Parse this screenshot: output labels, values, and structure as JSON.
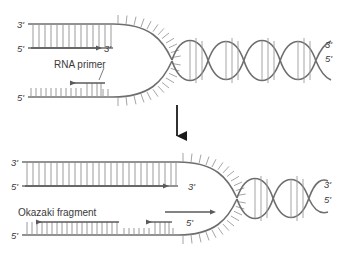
{
  "figure": {
    "background_color": "#ffffff",
    "stroke_color": "#6e6e6e",
    "rung_color": "#9a9a9a",
    "text_color": "#3a3a3a",
    "arrow_color": "#5a5a5a",
    "transition_arrow_color": "#1a1a1a"
  },
  "panels": [
    {
      "id": "panel-top",
      "name": "replication-fork-initial",
      "labels": {
        "leading_template_5prime_left": "3'",
        "leading_new_5prime_left": "5'",
        "leading_new_3prime_arrow": "3'",
        "lagging_template_5prime_left": "5'",
        "helix_3prime_right": "3'",
        "helix_5prime_right": "5'",
        "annotation": "RNA primer"
      },
      "helix_turns": 5
    },
    {
      "id": "panel-bottom",
      "name": "replication-fork-advanced",
      "labels": {
        "leading_template_3prime_left": "3'",
        "leading_new_5prime_left": "5'",
        "leading_new_3prime_arrow": "3'",
        "lagging_template_5prime_left": "5'",
        "lagging_primer_5prime": "5'",
        "helix_3prime_right": "3'",
        "helix_5prime_right": "5'",
        "annotation": "Okazaki fragment"
      },
      "helix_turns": 3
    }
  ],
  "transition": {
    "name": "downward-progress-arrow",
    "direction": "down"
  }
}
